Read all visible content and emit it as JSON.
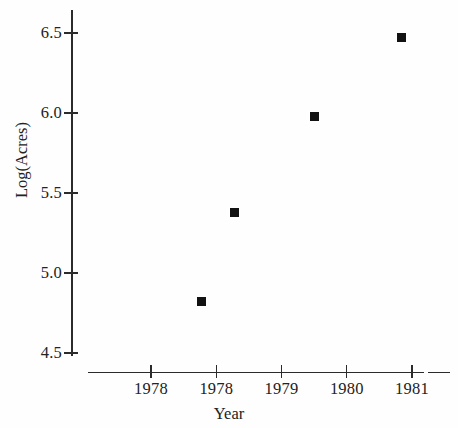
{
  "chart_data": {
    "type": "scatter",
    "title": "",
    "subtitle": "",
    "xlabel": "Year",
    "ylabel": "Log(Acres)",
    "x_tick_labels": [
      "1978",
      "1978",
      "1979",
      "1980",
      "1981"
    ],
    "y_tick_labels": [
      "4.5",
      "5.0",
      "5.5",
      "6.0",
      "6.5"
    ],
    "y_tick_values": [
      4.5,
      5.0,
      5.5,
      6.0,
      6.5
    ],
    "ylim": [
      4.38,
      6.58
    ],
    "xlim": [
      1977.55,
      1981.45
    ],
    "grid": false,
    "legend": false,
    "marker_style": "filled-square",
    "marker_color": "#121212",
    "series": [
      {
        "name": "Log(Acres)",
        "x": [
          1978.3,
          1978.8,
          1980.0,
          1981.3
        ],
        "y": [
          4.82,
          5.38,
          5.98,
          6.47
        ]
      }
    ],
    "points": [
      {
        "label": "point-1",
        "x": 1978.3,
        "y": 4.82
      },
      {
        "label": "point-2",
        "x": 1978.8,
        "y": 5.38
      },
      {
        "label": "point-3",
        "x": 1980.0,
        "y": 5.98
      },
      {
        "label": "point-4",
        "x": 1981.3,
        "y": 6.47
      }
    ]
  },
  "axis": {
    "x_tick_positions_px": [
      151,
      216.3,
      281.5,
      346.8,
      412
    ],
    "y_tick_positions_px": [
      353,
      273,
      193,
      113,
      33
    ],
    "axis_color": "#2b2b2b"
  }
}
